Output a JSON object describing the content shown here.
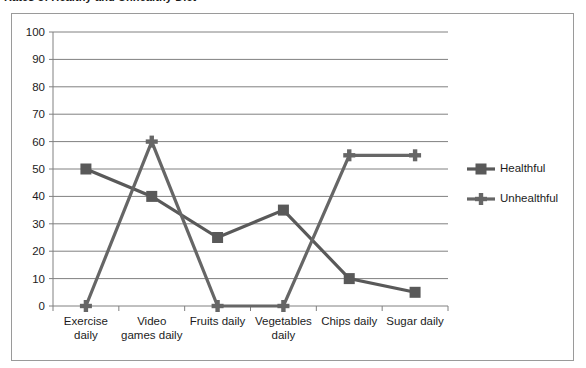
{
  "title": {
    "text": "Rates of Healthy and Unhealthy Diet",
    "clipped": true
  },
  "chart_data": {
    "type": "line",
    "title": "Rates of Healthy and Unhealthy Diet",
    "xlabel": "",
    "ylabel": "",
    "ylim": [
      0,
      100
    ],
    "ytick_step": 10,
    "yticks": [
      "0",
      "10",
      "20",
      "30",
      "40",
      "50",
      "60",
      "70",
      "80",
      "90",
      "100"
    ],
    "grid": true,
    "legend_position": "right",
    "categories": [
      "Exercise daily",
      "Video games daily",
      "Fruits daily",
      "Vegetables daily",
      "Chips daily",
      "Sugar daily"
    ],
    "category_lines": [
      [
        "Exercise",
        "daily"
      ],
      [
        "Video",
        "games daily"
      ],
      [
        "Fruits daily"
      ],
      [
        "Vegetables",
        "daily"
      ],
      [
        "Chips daily"
      ],
      [
        "Sugar daily"
      ]
    ],
    "series": [
      {
        "name": "Healthful",
        "marker": "square",
        "color": "#595959",
        "values": [
          50,
          40,
          25,
          35,
          10,
          5
        ]
      },
      {
        "name": "Unhealthful",
        "marker": "cross",
        "color": "#666666",
        "values": [
          0,
          60,
          0,
          0,
          55,
          55
        ]
      }
    ]
  },
  "legend": {
    "items": [
      {
        "label": "Healthful",
        "marker": "square",
        "color": "#595959"
      },
      {
        "label": "Unhealthful",
        "marker": "cross",
        "color": "#666666"
      }
    ]
  },
  "colors": {
    "frame_border": "#9a9a9a",
    "gridline": "#808080",
    "axis": "#808080",
    "series_healthful": "#595959",
    "series_unhealthful": "#666666",
    "text": "#1c1c1c",
    "background": "#ffffff"
  }
}
